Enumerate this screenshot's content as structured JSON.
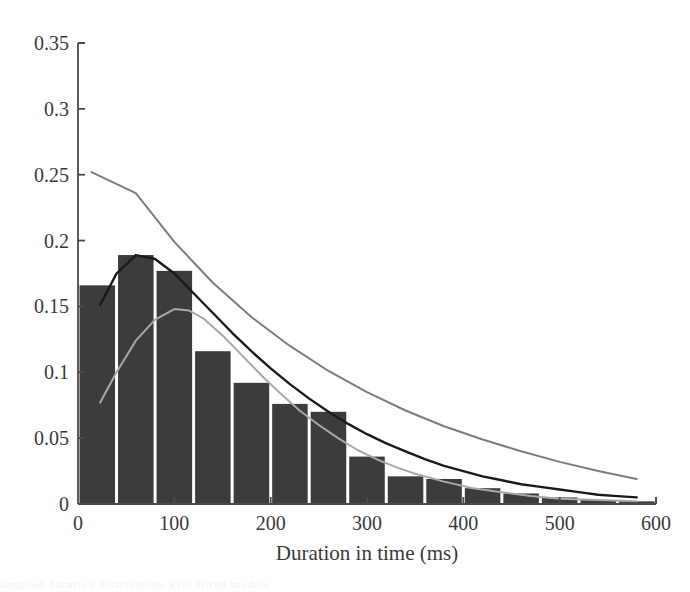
{
  "figure": {
    "background": "#ffffff",
    "bar_color": "#3c3c3c",
    "axis_color": "#4a4a4a",
    "curve_black_color": "#1a1a1a",
    "curve_gray_color": "#7d7d7d",
    "curve_lightgray_color": "#a8a8a8",
    "caption_faint": "sampled duration distribution with fitted models"
  },
  "axes": {
    "x_title": "Duration in time (ms)",
    "y_title": "",
    "x_ticks": [
      "0",
      "100",
      "200",
      "300",
      "400",
      "500",
      "600"
    ],
    "y_ticks": [
      "0",
      "0.05",
      "0.1",
      "0.15",
      "0.2",
      "0.25",
      "0.3",
      "0.35"
    ]
  },
  "chart_data": {
    "type": "bar",
    "title": "",
    "xlabel": "Duration in time (ms)",
    "ylabel": "",
    "xlim": [
      0,
      600
    ],
    "ylim": [
      0,
      0.35
    ],
    "xticks": [
      0,
      100,
      200,
      300,
      400,
      500,
      600
    ],
    "yticks": [
      0,
      0.05,
      0.1,
      0.15,
      0.2,
      0.25,
      0.3,
      0.35
    ],
    "grid": false,
    "legend": "none",
    "bin_width": 40,
    "categories": [
      20,
      60,
      100,
      140,
      180,
      220,
      260,
      300,
      340,
      380,
      420,
      460,
      500,
      540,
      580
    ],
    "values": [
      0.166,
      0.189,
      0.177,
      0.116,
      0.092,
      0.076,
      0.07,
      0.036,
      0.021,
      0.019,
      0.012,
      0.008,
      0.005,
      0.003,
      0.002
    ],
    "overlays": [
      {
        "name": "fit-black",
        "color": "#1a1a1a",
        "x": [
          23,
          40,
          60,
          80,
          100,
          120,
          140,
          160,
          180,
          200,
          220,
          240,
          260,
          280,
          300,
          320,
          340,
          360,
          380,
          400,
          420,
          440,
          460,
          480,
          500,
          520,
          540,
          560,
          580
        ],
        "y": [
          0.151,
          0.175,
          0.189,
          0.186,
          0.175,
          0.16,
          0.145,
          0.13,
          0.116,
          0.103,
          0.091,
          0.08,
          0.07,
          0.061,
          0.053,
          0.046,
          0.04,
          0.034,
          0.029,
          0.025,
          0.021,
          0.018,
          0.015,
          0.013,
          0.011,
          0.009,
          0.007,
          0.006,
          0.005
        ]
      },
      {
        "name": "fit-gray",
        "color": "#7d7d7d",
        "x": [
          14,
          60,
          100,
          140,
          180,
          220,
          260,
          300,
          340,
          380,
          420,
          460,
          500,
          540,
          580
        ],
        "y": [
          0.252,
          0.236,
          0.199,
          0.168,
          0.142,
          0.12,
          0.101,
          0.085,
          0.071,
          0.059,
          0.049,
          0.04,
          0.032,
          0.025,
          0.019
        ]
      },
      {
        "name": "fit-lightgray",
        "color": "#a8a8a8",
        "x": [
          23,
          40,
          60,
          80,
          100,
          115,
          130,
          150,
          170,
          190,
          210,
          230,
          250,
          270,
          290,
          310,
          330,
          350,
          380,
          410,
          440,
          470,
          500,
          540,
          580
        ],
        "y": [
          0.077,
          0.1,
          0.124,
          0.14,
          0.148,
          0.147,
          0.141,
          0.128,
          0.113,
          0.098,
          0.084,
          0.071,
          0.06,
          0.05,
          0.041,
          0.034,
          0.028,
          0.023,
          0.017,
          0.012,
          0.009,
          0.006,
          0.004,
          0.003,
          0.002
        ]
      }
    ]
  }
}
